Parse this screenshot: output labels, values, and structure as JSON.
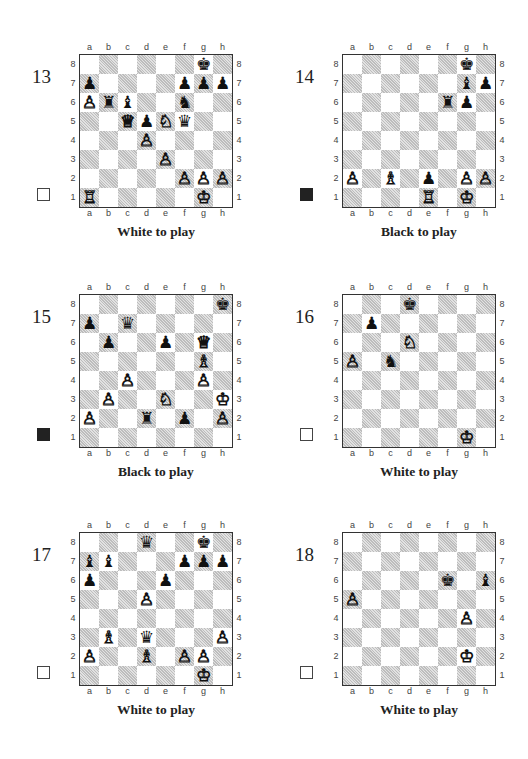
{
  "files": [
    "a",
    "b",
    "c",
    "d",
    "e",
    "f",
    "g",
    "h"
  ],
  "ranks": [
    "8",
    "7",
    "6",
    "5",
    "4",
    "3",
    "2",
    "1"
  ],
  "piece_glyphs": {
    "wK": "♔",
    "wQ": "♕",
    "wR": "♖",
    "wB": "♗",
    "wN": "♘",
    "wP": "♙",
    "bK": "♚",
    "bQ": "♛",
    "bR": "♜",
    "bB": "♝",
    "bN": "♞",
    "bP": "♟"
  },
  "diagrams": [
    {
      "number": "13",
      "to_move": "white",
      "caption": "White to play",
      "pieces": {
        "g8": "bK",
        "a7": "bP",
        "f7": "bP",
        "g7": "bP",
        "h7": "bP",
        "a6": "wP",
        "b6": "bR",
        "c6": "bB",
        "f6": "bN",
        "c5": "wQ",
        "d5": "bP",
        "e5": "wN",
        "f5": "bQ",
        "d4": "wP",
        "e3": "wP",
        "f2": "wP",
        "g2": "wP",
        "h2": "wP",
        "a1": "wR",
        "g1": "wK"
      }
    },
    {
      "number": "14",
      "to_move": "black",
      "caption": "Black to play",
      "pieces": {
        "g8": "bK",
        "g7": "bB",
        "h7": "bP",
        "f6": "bR",
        "g6": "bP",
        "a2": "wP",
        "c2": "wB",
        "e2": "bP",
        "g2": "wP",
        "h2": "wP",
        "e1": "wR",
        "g1": "wK"
      }
    },
    {
      "number": "15",
      "to_move": "black",
      "caption": "Black to play",
      "pieces": {
        "h8": "bK",
        "a7": "bP",
        "c7": "bQ",
        "b6": "bP",
        "e6": "bP",
        "g6": "wQ",
        "g5": "wB",
        "c4": "wP",
        "g4": "wP",
        "b3": "wP",
        "e3": "wN",
        "h3": "wK",
        "a2": "wP",
        "d2": "bR",
        "f2": "bP",
        "h2": "wP"
      }
    },
    {
      "number": "16",
      "to_move": "white",
      "caption": "White to play",
      "pieces": {
        "d8": "bK",
        "b7": "bP",
        "d6": "wN",
        "a5": "wP",
        "c5": "bN",
        "g1": "wK"
      }
    },
    {
      "number": "17",
      "to_move": "white",
      "caption": "White to play",
      "pieces": {
        "d8": "bQ",
        "g8": "bK",
        "a7": "bB",
        "b7": "bB",
        "f7": "bP",
        "g7": "bP",
        "h7": "bP",
        "a6": "bP",
        "e6": "bP",
        "d5": "wP",
        "b3": "wB",
        "d3": "bQ",
        "h3": "wP",
        "a2": "wP",
        "d2": "wB",
        "f2": "wP",
        "g2": "wP",
        "g1": "wK"
      }
    },
    {
      "number": "18",
      "to_move": "white",
      "caption": "White to play",
      "pieces": {
        "f6": "bK",
        "h6": "bB",
        "a5": "wP",
        "g4": "wP",
        "g2": "wK"
      }
    }
  ]
}
